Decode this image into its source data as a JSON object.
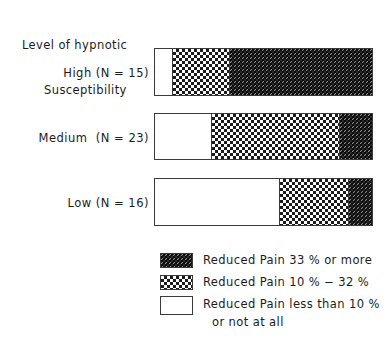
{
  "chart_data": {
    "type": "bar",
    "orientation": "horizontal",
    "stacked": true,
    "normalized": true,
    "title": "Level of hypnotic Susceptibility",
    "title_line1": "Level of hypnotic",
    "title_line2": "Susceptibility",
    "xlabel": "",
    "ylabel": "",
    "grid": false,
    "axis_visible": false,
    "xlim": [
      0,
      100
    ],
    "legend_position": "below",
    "categories": [
      "High (N = 15)",
      "Medium  (N = 23)",
      "Low (N = 16)"
    ],
    "category_n": [
      15,
      23,
      16
    ],
    "series": [
      {
        "name": "Reduced Pain less than 10 % or not at all",
        "legend_label_line1": "Reduced Pain less than 10 %",
        "legend_label_line2": "or not at all",
        "pattern": "none",
        "color": "#ffffff",
        "values": [
          8,
          26,
          57
        ]
      },
      {
        "name": "Reduced Pain 10 % − 32 %",
        "legend_label_line1": "Reduced Pain 10 % − 32 %",
        "legend_label_line2": "",
        "pattern": "checkerboard-coarse",
        "color": "#1b1b1b",
        "values": [
          26,
          59,
          32
        ]
      },
      {
        "name": "Reduced Pain 33 % or more",
        "legend_label_line1": "Reduced Pain 33 % or more",
        "legend_label_line2": "",
        "pattern": "checkerboard-fine-dark",
        "color": "#2a2a2a",
        "values": [
          66,
          15,
          11
        ]
      }
    ]
  },
  "bars": [
    {
      "label": "High (N = 15)",
      "segments": [
        {
          "series": "none",
          "pct": 8
        },
        {
          "series": "mid",
          "pct": 26
        },
        {
          "series": "dark",
          "pct": 66
        }
      ]
    },
    {
      "label": "Medium  (N = 23)",
      "segments": [
        {
          "series": "none",
          "pct": 26
        },
        {
          "series": "mid",
          "pct": 59
        },
        {
          "series": "dark",
          "pct": 15
        }
      ]
    },
    {
      "label": "Low (N = 16)",
      "segments": [
        {
          "series": "none",
          "pct": 57
        },
        {
          "series": "mid",
          "pct": 32
        },
        {
          "series": "dark",
          "pct": 11
        }
      ]
    }
  ],
  "legend": {
    "rows": [
      {
        "swatch": "dark",
        "text": "Reduced Pain 33 % or more",
        "text2": ""
      },
      {
        "swatch": "mid",
        "text": "Reduced Pain 10 % − 32 %",
        "text2": ""
      },
      {
        "swatch": "none",
        "text": "Reduced Pain less than 10 %",
        "text2": "or not at all"
      }
    ]
  },
  "colors": {
    "outline": "#3a3a3a",
    "text": "#1c1c1c",
    "background": "#ffffff",
    "pattern_dark": "#1b1b1b",
    "pattern_fill_dark": "#2a2a2a",
    "pattern_none": "#ffffff"
  }
}
